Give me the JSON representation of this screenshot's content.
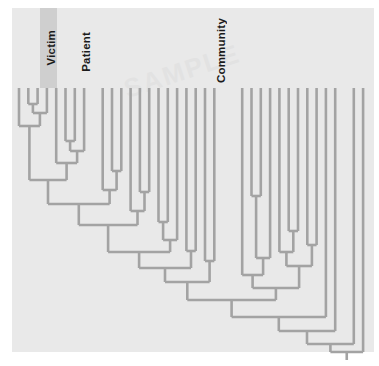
{
  "figure": {
    "type": "phylogenetic-tree",
    "orientation": "tips-top-root-bottom",
    "panel": {
      "x": 12,
      "y": 8,
      "width": 362,
      "height": 344,
      "background": "#e9e9e9"
    },
    "line_color": "#a3a3a3",
    "line_width": 2.6,
    "watermark_text": "SAMPLE"
  },
  "labels": [
    {
      "name": "victim",
      "text": "Victim",
      "x": 51,
      "y": 30,
      "rotated": true,
      "highlight": {
        "x": 40,
        "y": 8,
        "width": 17,
        "height": 80,
        "color": "#cfcfcf"
      }
    },
    {
      "name": "patient",
      "text": "Patient",
      "x": 86,
      "y": 32,
      "rotated": true,
      "highlight": null
    },
    {
      "name": "community",
      "text": "Community",
      "x": 221,
      "y": 18,
      "rotated": true,
      "highlight": null
    }
  ],
  "chart_data": {
    "type": "tree",
    "title": "",
    "group_labels": [
      "Victim",
      "Patient",
      "Community"
    ],
    "n_tips": 38,
    "tip_x_start": 19.0,
    "tip_spacing": 9.3,
    "tip_y": 88,
    "root": {
      "x": 347,
      "y": 352
    },
    "tips": [
      {
        "i": 0,
        "x": 19.0,
        "group": "Victim"
      },
      {
        "i": 1,
        "x": 28.3,
        "group": "Victim"
      },
      {
        "i": 2,
        "x": 37.6,
        "group": "Victim"
      },
      {
        "i": 3,
        "x": 46.9,
        "group": "Victim"
      },
      {
        "i": 4,
        "x": 56.2,
        "group": "Patient"
      },
      {
        "i": 5,
        "x": 65.5,
        "group": "Patient"
      },
      {
        "i": 6,
        "x": 74.8,
        "group": "Patient"
      },
      {
        "i": 7,
        "x": 84.1,
        "group": "Patient"
      },
      {
        "i": 8,
        "x": 93.4,
        "group": "Patient"
      },
      {
        "i": 9,
        "x": 102.7,
        "group": "Community"
      },
      {
        "i": 10,
        "x": 112.0,
        "group": "Community"
      },
      {
        "i": 11,
        "x": 121.3,
        "group": "Community"
      },
      {
        "i": 12,
        "x": 130.6,
        "group": "Community"
      },
      {
        "i": 13,
        "x": 139.9,
        "group": "Community"
      },
      {
        "i": 14,
        "x": 149.2,
        "group": "Community"
      },
      {
        "i": 15,
        "x": 158.5,
        "group": "Community"
      },
      {
        "i": 16,
        "x": 167.8,
        "group": "Community"
      },
      {
        "i": 17,
        "x": 177.1,
        "group": "Community"
      },
      {
        "i": 18,
        "x": 186.4,
        "group": "Community"
      },
      {
        "i": 19,
        "x": 195.7,
        "group": "Community"
      },
      {
        "i": 20,
        "x": 205.0,
        "group": "Community"
      },
      {
        "i": 21,
        "x": 214.3,
        "group": "Community"
      },
      {
        "i": 22,
        "x": 223.6,
        "group": "Community"
      },
      {
        "i": 23,
        "x": 232.9,
        "group": "Community"
      },
      {
        "i": 24,
        "x": 242.2,
        "group": "Community"
      },
      {
        "i": 25,
        "x": 251.5,
        "group": "Community"
      },
      {
        "i": 26,
        "x": 260.8,
        "group": "Community"
      },
      {
        "i": 27,
        "x": 270.1,
        "group": "Community"
      },
      {
        "i": 28,
        "x": 279.4,
        "group": "Community"
      },
      {
        "i": 29,
        "x": 288.7,
        "group": "Community"
      },
      {
        "i": 30,
        "x": 298.0,
        "group": "Community"
      },
      {
        "i": 31,
        "x": 307.3,
        "group": "Community"
      },
      {
        "i": 32,
        "x": 316.6,
        "group": "Community"
      },
      {
        "i": 33,
        "x": 325.9,
        "group": "Community"
      },
      {
        "i": 34,
        "x": 335.2,
        "group": "Community"
      },
      {
        "i": 35,
        "x": 344.5,
        "group": "Community"
      },
      {
        "i": 36,
        "x": 353.8,
        "group": "Community"
      },
      {
        "i": 37,
        "x": 363.1,
        "group": "Community"
      }
    ],
    "nodes": [
      {
        "id": "n1",
        "left": 28.3,
        "right": 37.6,
        "y": 104,
        "lc": "tip",
        "rc": "tip"
      },
      {
        "id": "n2",
        "left": 32.9,
        "right": 46.9,
        "y": 113,
        "lc": "n1",
        "rc": "tip"
      },
      {
        "id": "n3",
        "left": 19.0,
        "right": 39.9,
        "y": 126,
        "lc": "tip",
        "rc": "n2"
      },
      {
        "id": "n4",
        "left": 65.5,
        "right": 74.8,
        "y": 141,
        "lc": "tip",
        "rc": "tip"
      },
      {
        "id": "n5",
        "left": 70.1,
        "right": 84.1,
        "y": 151,
        "lc": "n4",
        "rc": "tip"
      },
      {
        "id": "n6",
        "left": 56.2,
        "right": 77.1,
        "y": 163,
        "lc": "tip",
        "rc": "n5"
      },
      {
        "id": "n7",
        "left": 29.4,
        "right": 66.6,
        "y": 180,
        "lc": "n3",
        "rc": "n6"
      },
      {
        "id": "n8",
        "left": 112.0,
        "right": 121.3,
        "y": 171,
        "lc": "tip",
        "rc": "tip"
      },
      {
        "id": "n9",
        "left": 102.7,
        "right": 116.6,
        "y": 190,
        "lc": "tip",
        "rc": "n8"
      },
      {
        "id": "n10",
        "left": 48.0,
        "right": 109.6,
        "y": 204,
        "lc": "n7",
        "rc": "n9"
      },
      {
        "id": "n11",
        "left": 139.9,
        "right": 149.2,
        "y": 192,
        "lc": "tip",
        "rc": "tip"
      },
      {
        "id": "n12",
        "left": 130.6,
        "right": 144.5,
        "y": 211,
        "lc": "tip",
        "rc": "n11"
      },
      {
        "id": "n13",
        "left": 78.8,
        "right": 137.5,
        "y": 225,
        "lc": "n10",
        "rc": "n12"
      },
      {
        "id": "n14",
        "left": 158.5,
        "right": 167.8,
        "y": 222,
        "lc": "tip",
        "rc": "tip"
      },
      {
        "id": "n15",
        "left": 163.1,
        "right": 177.1,
        "y": 240,
        "lc": "n14",
        "rc": "tip"
      },
      {
        "id": "n16",
        "left": 108.1,
        "right": 170.1,
        "y": 252,
        "lc": "n13",
        "rc": "n15"
      },
      {
        "id": "n17",
        "left": 186.4,
        "right": 195.7,
        "y": 251,
        "lc": "tip",
        "rc": "tip"
      },
      {
        "id": "n18",
        "left": 139.1,
        "right": 191.0,
        "y": 268,
        "lc": "n16",
        "rc": "n17"
      },
      {
        "id": "n19",
        "left": 205.0,
        "right": 214.3,
        "y": 261,
        "lc": "tip",
        "rc": "tip"
      },
      {
        "id": "n20",
        "left": 165.0,
        "right": 209.6,
        "y": 282,
        "lc": "n18",
        "rc": "n19"
      },
      {
        "id": "n21",
        "left": 251.5,
        "right": 260.8,
        "y": 196,
        "lc": "tip",
        "rc": "tip"
      },
      {
        "id": "n22",
        "left": 256.1,
        "right": 270.1,
        "y": 258,
        "lc": "n21",
        "rc": "tip"
      },
      {
        "id": "n23",
        "left": 242.2,
        "right": 263.1,
        "y": 275,
        "lc": "tip",
        "rc": "n22"
      },
      {
        "id": "n24",
        "left": 288.7,
        "right": 298.0,
        "y": 231,
        "lc": "tip",
        "rc": "tip"
      },
      {
        "id": "n25",
        "left": 279.4,
        "right": 293.3,
        "y": 252,
        "lc": "tip",
        "rc": "n24"
      },
      {
        "id": "n26",
        "left": 307.3,
        "right": 316.6,
        "y": 245,
        "lc": "tip",
        "rc": "tip"
      },
      {
        "id": "n27",
        "left": 286.4,
        "right": 311.9,
        "y": 266,
        "lc": "n25",
        "rc": "n26"
      },
      {
        "id": "n28",
        "left": 252.6,
        "right": 299.1,
        "y": 288,
        "lc": "n23",
        "rc": "n27"
      },
      {
        "id": "n29",
        "left": 187.3,
        "right": 275.9,
        "y": 300,
        "lc": "n20",
        "rc": "n28"
      },
      {
        "id": "n30",
        "left": 231.6,
        "right": 325.9,
        "y": 317,
        "lc": "n29",
        "rc": "tip"
      },
      {
        "id": "n31",
        "left": 278.8,
        "right": 335.2,
        "y": 331,
        "lc": "n30",
        "rc": "tip"
      },
      {
        "id": "n32",
        "left": 307.0,
        "right": 353.8,
        "y": 344,
        "lc": "n31",
        "rc": "tip"
      },
      {
        "id": "n33",
        "left": 330.4,
        "right": 363.1,
        "y": 352,
        "lc": "n32",
        "rc": "tip"
      }
    ]
  }
}
